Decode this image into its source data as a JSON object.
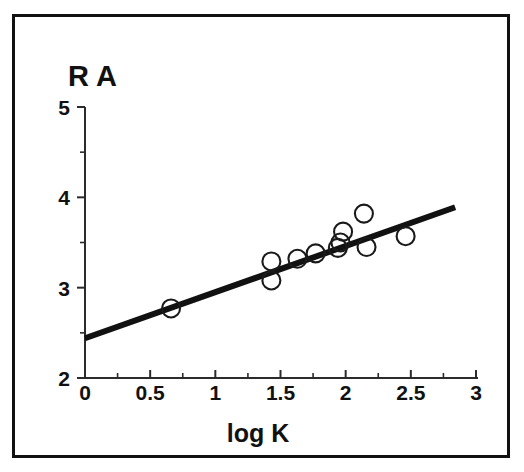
{
  "figure": {
    "frame_border_color": "#111111",
    "background_color": "#ffffff",
    "ylabel_text": "R A",
    "xlabel_text": "log K"
  },
  "axes": {
    "x_tick_labels": [
      "0",
      "0.5",
      "1",
      "1.5",
      "2",
      "2.5",
      "3"
    ],
    "y_tick_labels": [
      "5",
      "4",
      "3",
      "2"
    ]
  },
  "chart_data": {
    "type": "scatter",
    "title": "",
    "subtitle": "",
    "xlabel": "log K",
    "ylabel": "R A",
    "xlim": [
      0,
      3
    ],
    "ylim": [
      2,
      5
    ],
    "xticks": [
      0,
      0.5,
      1,
      1.5,
      2,
      2.5,
      3
    ],
    "yticks": [
      2,
      3,
      4,
      5
    ],
    "x_minor_ticks": [
      0.25,
      0.75,
      1.25,
      1.75,
      2.25,
      2.75
    ],
    "y_minor_ticks": [
      2.5,
      3.5,
      4.5
    ],
    "grid": false,
    "legend": null,
    "marker_style": "open-circle",
    "marker_color": "#1a1a1a",
    "marker_radius_px": 9,
    "points": [
      {
        "x": 0.66,
        "y": 2.77
      },
      {
        "x": 1.43,
        "y": 3.29
      },
      {
        "x": 1.43,
        "y": 3.08
      },
      {
        "x": 1.63,
        "y": 3.32
      },
      {
        "x": 1.77,
        "y": 3.38
      },
      {
        "x": 1.94,
        "y": 3.44
      },
      {
        "x": 1.96,
        "y": 3.5
      },
      {
        "x": 1.98,
        "y": 3.62
      },
      {
        "x": 2.14,
        "y": 3.82
      },
      {
        "x": 2.16,
        "y": 3.45
      },
      {
        "x": 2.46,
        "y": 3.57
      }
    ],
    "series": [
      {
        "name": "data",
        "type": "scatter",
        "x": [
          0.66,
          1.43,
          1.43,
          1.63,
          1.77,
          1.94,
          1.96,
          1.98,
          2.14,
          2.16,
          2.46
        ],
        "y": [
          2.77,
          3.29,
          3.08,
          3.32,
          3.38,
          3.44,
          3.5,
          3.62,
          3.82,
          3.45,
          3.57
        ]
      },
      {
        "name": "regression-line",
        "type": "line",
        "color": "#111111",
        "x": [
          0.0,
          2.84
        ],
        "y": [
          2.44,
          3.89
        ],
        "slope": 0.51,
        "intercept": 2.44
      }
    ]
  }
}
